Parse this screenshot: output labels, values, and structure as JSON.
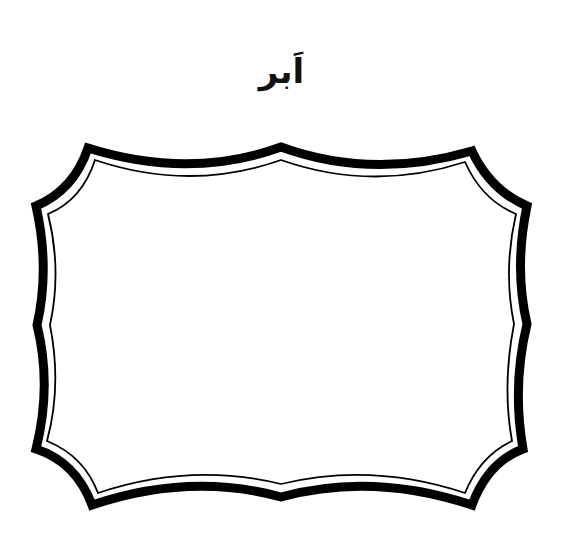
{
  "worksheet": {
    "title": "اَبر",
    "frame_shape": "decorative-bracket-frame",
    "colors": {
      "ink": "#000000",
      "background": "#ffffff"
    }
  }
}
